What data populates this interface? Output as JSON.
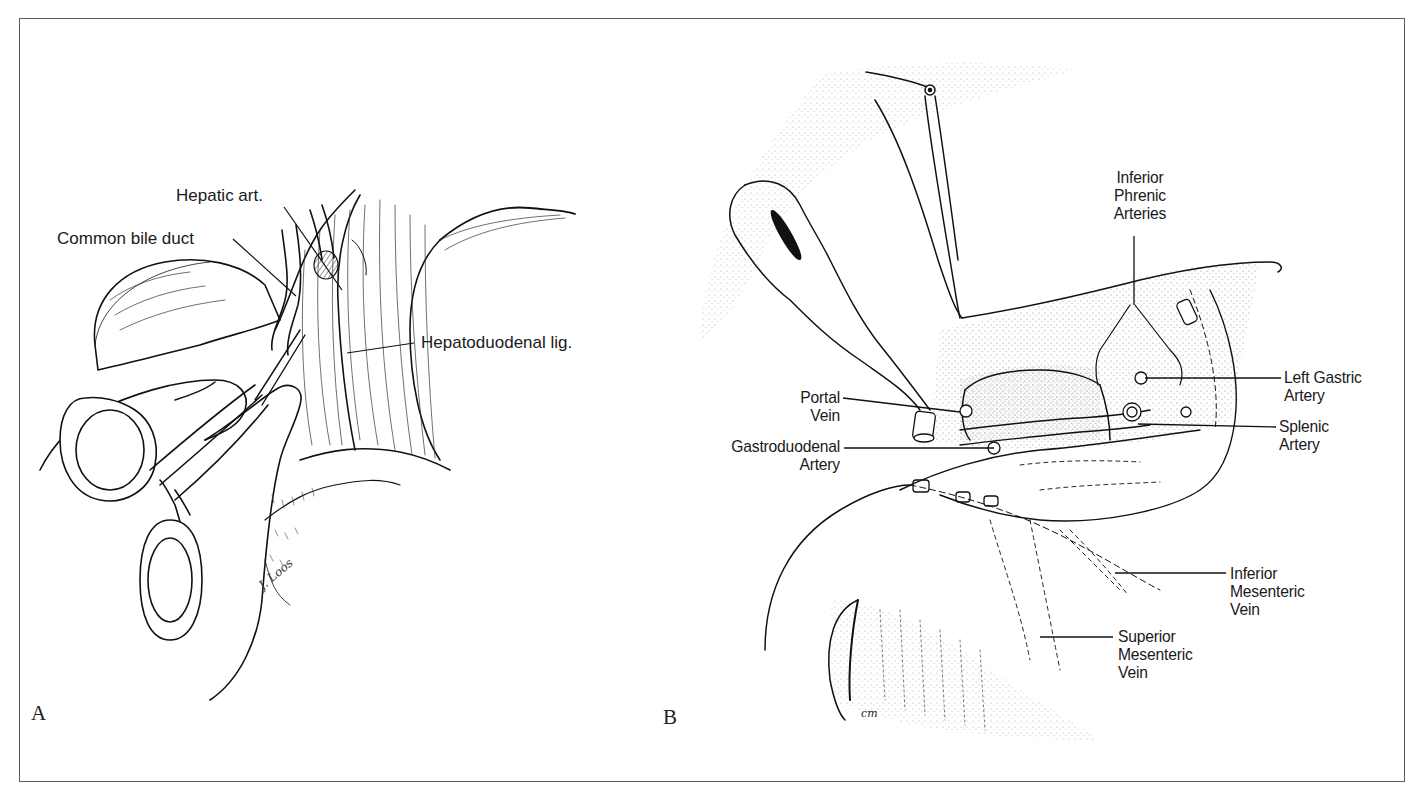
{
  "figure": {
    "panels": [
      {
        "id": "A",
        "letter": "A",
        "labels": {
          "hepatic_art": "Hepatic art.",
          "common_bile_duct": "Common bile duct",
          "hepatoduodenal_lig": "Hepatoduodenal lig."
        },
        "signature": "J. Loos"
      },
      {
        "id": "B",
        "letter": "B",
        "labels": {
          "inferior_phrenic_1": "Inferior",
          "inferior_phrenic_2": "Phrenic",
          "inferior_phrenic_3": "Arteries",
          "portal_vein_1": "Portal",
          "portal_vein_2": "Vein",
          "gastroduodenal_1": "Gastroduodenal",
          "gastroduodenal_2": "Artery",
          "left_gastric_1": "Left Gastric",
          "left_gastric_2": "Artery",
          "splenic_1": "Splenic",
          "splenic_2": "Artery",
          "inferior_mesenteric_1": "Inferior",
          "inferior_mesenteric_2": "Mesenteric",
          "inferior_mesenteric_3": "Vein",
          "superior_mesenteric_1": "Superior",
          "superior_mesenteric_2": "Mesenteric",
          "superior_mesenteric_3": "Vein"
        },
        "signature": "cm"
      }
    ]
  }
}
